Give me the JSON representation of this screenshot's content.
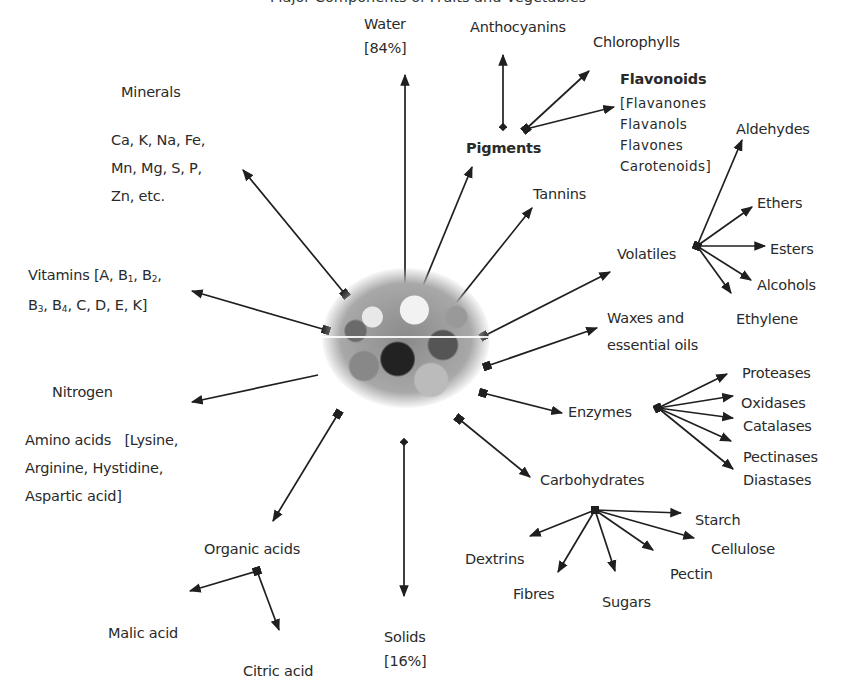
{
  "title_fragment": "Major Components of Fruits and Vegetables",
  "center": {
    "name": "fruits-and-vegetables-image"
  },
  "labels": {
    "water": [
      "Water",
      "[84%]"
    ],
    "solids": [
      "Solids",
      "[16%]"
    ],
    "minerals_heading": "Minerals",
    "minerals_list": [
      "Ca, K, Na, Fe,",
      "Mn, Mg, S, P,",
      "Zn, etc."
    ],
    "vitamins": [
      "Vitamins [A, B",
      "1",
      ", B",
      "2",
      ",",
      "B",
      "3",
      ", B",
      "4",
      ", C, D, E, K]"
    ],
    "nitrogen": "Nitrogen",
    "amino_acids": [
      "Amino acids   [Lysine,",
      "Arginine, Hystidine,",
      "Aspartic acid]"
    ],
    "organic_acids": "Organic acids",
    "malic_acid": "Malic acid",
    "citric_acid": "Citric acid",
    "pigments": "Pigments",
    "anthocyanins": "Anthocyanins",
    "chlorophylls": "Chlorophylls",
    "flavonoids": "Flavonoids",
    "flavonoids_list": [
      "[Flavanones",
      "Flavanols",
      "Flavones",
      "Carotenoids]"
    ],
    "tannins": "Tannins",
    "volatiles": "Volatiles",
    "aldehydes": "Aldehydes",
    "ethers": "Ethers",
    "esters": "Esters",
    "alcohols": "Alcohols",
    "ethylene": "Ethylene",
    "waxes": [
      "Waxes and",
      "essential oils"
    ],
    "enzymes": "Enzymes",
    "proteases": "Proteases",
    "oxidases": "Oxidases",
    "catalases": "Catalases",
    "pectinases": "Pectinases",
    "diastases": "Diastases",
    "carbohydrates": "Carbohydrates",
    "starch": "Starch",
    "cellulose": "Cellulose",
    "pectin": "Pectin",
    "sugars": "Sugars",
    "fibres": "Fibres",
    "dextrins": "Dextrins"
  },
  "edges": [
    {
      "from": "center",
      "to": "Water"
    },
    {
      "from": "center",
      "to": "Minerals"
    },
    {
      "from": "center",
      "to": "Vitamins"
    },
    {
      "from": "center",
      "to": "Nitrogen"
    },
    {
      "from": "center",
      "to": "Organic acids"
    },
    {
      "from": "center",
      "to": "Solids"
    },
    {
      "from": "center",
      "to": "Carbohydrates"
    },
    {
      "from": "center",
      "to": "Enzymes"
    },
    {
      "from": "center",
      "to": "Waxes and essential oils"
    },
    {
      "from": "center",
      "to": "Volatiles"
    },
    {
      "from": "center",
      "to": "Tannins"
    },
    {
      "from": "center",
      "to": "Pigments"
    },
    {
      "from": "Pigments",
      "to": "Anthocyanins"
    },
    {
      "from": "Pigments",
      "to": "Chlorophylls"
    },
    {
      "from": "Pigments",
      "to": "Flavonoids"
    },
    {
      "from": "Volatiles",
      "to": "Aldehydes"
    },
    {
      "from": "Volatiles",
      "to": "Ethers"
    },
    {
      "from": "Volatiles",
      "to": "Esters"
    },
    {
      "from": "Volatiles",
      "to": "Alcohols"
    },
    {
      "from": "Volatiles",
      "to": "Ethylene"
    },
    {
      "from": "Enzymes",
      "to": "Proteases"
    },
    {
      "from": "Enzymes",
      "to": "Oxidases"
    },
    {
      "from": "Enzymes",
      "to": "Catalases"
    },
    {
      "from": "Enzymes",
      "to": "Pectinases"
    },
    {
      "from": "Enzymes",
      "to": "Diastases"
    },
    {
      "from": "Carbohydrates",
      "to": "Starch"
    },
    {
      "from": "Carbohydrates",
      "to": "Cellulose"
    },
    {
      "from": "Carbohydrates",
      "to": "Pectin"
    },
    {
      "from": "Carbohydrates",
      "to": "Sugars"
    },
    {
      "from": "Carbohydrates",
      "to": "Fibres"
    },
    {
      "from": "Carbohydrates",
      "to": "Dextrins"
    },
    {
      "from": "Organic acids",
      "to": "Malic acid"
    },
    {
      "from": "Organic acids",
      "to": "Citric acid"
    }
  ],
  "colors": {
    "line": "#1f1f1f",
    "text": "#2a2a2a",
    "background": "#ffffff"
  }
}
